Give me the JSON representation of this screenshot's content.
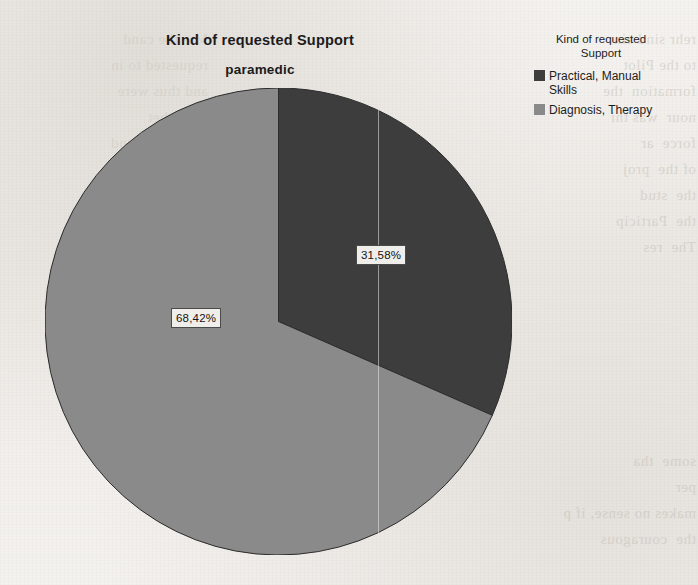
{
  "chart_data": {
    "type": "pie",
    "title": "Kind of requested Support",
    "subtitle": "paramedic",
    "xlabel": "",
    "ylabel": "",
    "legend_position": "right",
    "legend_title": "Kind of requested\nSupport",
    "categories": [
      "Practical, Manual Skills",
      "Diagnosis, Therapy"
    ],
    "values": [
      31.58,
      68.42
    ],
    "value_labels": [
      "31,58%",
      "68,42%"
    ],
    "slices": [
      {
        "label": "Practical, Manual Skills",
        "legend_label": "Practical, Manual\nSkills",
        "value": 31.58,
        "value_label": "31,58%",
        "color": "#3d3d3d",
        "start_angle_deg": 0,
        "sweep_deg": 113.7
      },
      {
        "label": "Diagnosis, Therapy",
        "legend_label": "Diagnosis, Therapy",
        "value": 68.42,
        "value_label": "68,42%",
        "color": "#8a8a8a",
        "start_angle_deg": 113.7,
        "sweep_deg": 246.3
      }
    ]
  },
  "colors": {
    "series_dark": "#3d3d3d",
    "series_light": "#8a8a8a",
    "page_background": "#f3f1ee",
    "text": "#1b1b1b",
    "label_box_border": "#4a4a4a"
  },
  "background_noise": {
    "right_column": "rehr sind ein\nto the Pilot\nformation  the\nnour  was thi\nforce  ar\nof the  proj\nthe  stud\nthe  Particip\nThe  res\n",
    "left_column": "M e the cand\nrequested to in\nand thus were\nnone  bet\nthe   Pilot  und\nformation  the\nhour was thi\nforce ar\nof the project\nthe studen\nthe Participa\nThe resul\n",
    "bottom_column": "some  tha\nper\nmakes no sense, if p\nthe  couragous\n"
  }
}
